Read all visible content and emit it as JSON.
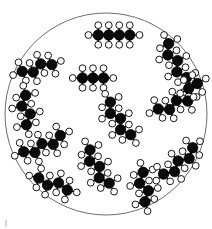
{
  "figure": {
    "kind": "molecular-diagram",
    "background_color": "#ffffff"
  },
  "container": {
    "shape": "circle",
    "cx": 106,
    "cy": 114,
    "r": 101,
    "stroke_color": "#6e6e6e",
    "stroke_width": 1,
    "fill_color": "#ffffff"
  },
  "atom_style": {
    "carbon_color": "#0a0a0a",
    "carbon_outline": "#000000",
    "carbon_radius": 5.2,
    "hydrogen_color": "#ffffff",
    "hydrogen_outline": "#000000",
    "hydrogen_radius": 3.4,
    "bond_color": "#1a1a1a",
    "bond_width": 2.2,
    "hydrogen_bond_width": 1.4
  },
  "legend": {
    "carbon_label": "C",
    "hydrogen_label": "H"
  },
  "molecule_count": 13,
  "molecules": [
    {
      "id": "molecule-top-center",
      "name": "butane",
      "carbon_count": 4,
      "cx": 114,
      "cy": 35,
      "angle_deg": 0,
      "zigzag_amplitude": 0,
      "bond_length": 10.5,
      "h_per_end": 3,
      "h_per_mid": 2
    },
    {
      "id": "molecule-upper-left",
      "name": "butane",
      "carbon_count": 4,
      "cx": 37,
      "cy": 68,
      "angle_deg": -22,
      "zigzag_amplitude": 2.4,
      "bond_length": 10,
      "h_per_end": 3,
      "h_per_mid": 2
    },
    {
      "id": "molecule-upper-right",
      "name": "pentane",
      "carbon_count": 5,
      "cx": 175,
      "cy": 62,
      "angle_deg": 62,
      "zigzag_amplitude": 3.0,
      "bond_length": 9.6,
      "h_per_end": 3,
      "h_per_mid": 2
    },
    {
      "id": "molecule-center-upper",
      "name": "propane",
      "carbon_count": 3,
      "cx": 93,
      "cy": 78,
      "angle_deg": 0,
      "zigzag_amplitude": 0,
      "bond_length": 10.5,
      "h_per_end": 3,
      "h_per_mid": 2
    },
    {
      "id": "molecule-left-middle",
      "name": "butane",
      "carbon_count": 4,
      "cx": 26,
      "cy": 110,
      "angle_deg": 76,
      "zigzag_amplitude": 3.2,
      "bond_length": 9.6,
      "h_per_end": 3,
      "h_per_mid": 2
    },
    {
      "id": "molecule-center",
      "name": "pentane",
      "carbon_count": 5,
      "cx": 118,
      "cy": 120,
      "angle_deg": 58,
      "zigzag_amplitude": 3.0,
      "bond_length": 9.6,
      "h_per_end": 3,
      "h_per_mid": 2
    },
    {
      "id": "molecule-right-middle",
      "name": "butane",
      "carbon_count": 4,
      "cx": 173,
      "cy": 105,
      "angle_deg": -25,
      "zigzag_amplitude": 2.6,
      "bond_length": 10,
      "h_per_end": 3,
      "h_per_mid": 2
    },
    {
      "id": "molecule-left-lower",
      "name": "pentane",
      "carbon_count": 5,
      "cx": 43,
      "cy": 146,
      "angle_deg": -24,
      "zigzag_amplitude": 2.6,
      "bond_length": 10,
      "h_per_end": 3,
      "h_per_mid": 2
    },
    {
      "id": "molecule-bottom-center",
      "name": "pentane",
      "carbon_count": 5,
      "cx": 97,
      "cy": 168,
      "angle_deg": 60,
      "zigzag_amplitude": 3.0,
      "bond_length": 9.6,
      "h_per_end": 3,
      "h_per_mid": 2
    },
    {
      "id": "molecule-bottom-left",
      "name": "butane",
      "carbon_count": 4,
      "cx": 53,
      "cy": 184,
      "angle_deg": 14,
      "zigzag_amplitude": 2.4,
      "bond_length": 10.2,
      "h_per_end": 3,
      "h_per_mid": 2
    },
    {
      "id": "molecule-bottom-right-inner",
      "name": "butane",
      "carbon_count": 4,
      "cx": 144,
      "cy": 187,
      "angle_deg": 74,
      "zigzag_amplitude": 3.2,
      "bond_length": 9.6,
      "h_per_end": 3,
      "h_per_mid": 2
    },
    {
      "id": "molecule-bottom-right-outer",
      "name": "pentane",
      "carbon_count": 5,
      "cx": 180,
      "cy": 163,
      "angle_deg": -42,
      "zigzag_amplitude": 2.8,
      "bond_length": 9.8,
      "h_per_end": 3,
      "h_per_mid": 2
    },
    {
      "id": "molecule-far-right-upper",
      "name": "ethane",
      "carbon_count": 2,
      "cx": 193,
      "cy": 86,
      "angle_deg": -30,
      "zigzag_amplitude": 0,
      "bond_length": 10,
      "h_per_end": 3,
      "h_per_mid": 2
    }
  ],
  "corner_mark": {
    "name": "page-edge-mark",
    "color": "#d8d8d8"
  }
}
